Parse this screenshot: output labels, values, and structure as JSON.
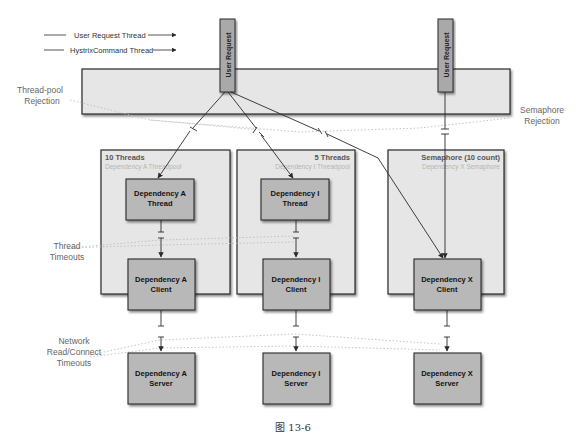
{
  "legend": {
    "items": [
      {
        "label": "User Request Thread"
      },
      {
        "label": "HystrixCommand Thread"
      }
    ]
  },
  "user_requests": [
    {
      "label": "User Request"
    },
    {
      "label": "User Request"
    }
  ],
  "side_labels": {
    "thread_pool_rejection": [
      "Thread-pool",
      "Rejection"
    ],
    "semaphore_rejection": [
      "Semaphore",
      "Rejection"
    ],
    "thread_timeouts": [
      "Thread",
      "Timeouts"
    ],
    "network_timeouts": [
      "Network",
      "Read/Connect",
      "Timeouts"
    ]
  },
  "groups": [
    {
      "title": "10 Threads",
      "subtitle": "Dependency A Threadpool",
      "thread_box": [
        "Dependency A",
        "Thread"
      ],
      "client_box": [
        "Dependency A",
        "Client"
      ],
      "server_box": [
        "Dependency A",
        "Server"
      ]
    },
    {
      "title": "5 Threads",
      "subtitle": "Dependency I Threadpool",
      "thread_box": [
        "Dependency I",
        "Thread"
      ],
      "client_box": [
        "Dependency I",
        "Client"
      ],
      "server_box": [
        "Dependency I",
        "Server"
      ]
    },
    {
      "title": "Semaphore (10 count)",
      "subtitle": "Dependency X Semaphore",
      "client_box": [
        "Dependency X",
        "Client"
      ],
      "server_box": [
        "Dependency X",
        "Server"
      ]
    }
  ],
  "caption": "图 13-6",
  "colors": {
    "panel_fill": "#e6e6e6",
    "box_fill": "#b8b8b8",
    "stroke": "#2a2a2a",
    "label_gray": "#666666",
    "subtitle_gray": "#b5b5b5",
    "dotted": "#bdbdbd"
  }
}
